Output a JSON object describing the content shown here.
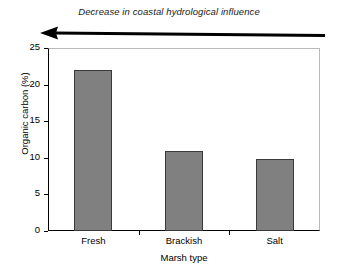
{
  "chart_data": {
    "type": "bar",
    "title": "",
    "subtitle": "",
    "categories": [
      "Fresh",
      "Brackish",
      "Salt"
    ],
    "values": [
      22,
      10.9,
      9.8
    ],
    "xlabel": "Marsh type",
    "ylabel": "Organic carbon (%)",
    "ylim": [
      0,
      25
    ],
    "yticks": [
      0,
      5,
      10,
      15,
      20,
      25
    ],
    "ytick_labels": [
      "0",
      "5",
      "10",
      "15",
      "20",
      "25"
    ],
    "grid": false,
    "legend": "none",
    "bar_color": "#808080",
    "bar_edge_color": "#3a3a3a",
    "annotations": [
      {
        "name": "decrease-arrow-caption",
        "text": "Decrease in coastal hydrological influence",
        "style": "italic",
        "arrow_direction": "left"
      }
    ]
  },
  "annotation": {
    "caption": "Decrease in coastal hydrological influence",
    "arrow_name": "left-arrow-icon"
  },
  "axes": {
    "y_title": "Organic carbon (%)",
    "x_title": "Marsh type",
    "y_ticks": [
      {
        "label": "25",
        "value": 25
      },
      {
        "label": "20",
        "value": 20
      },
      {
        "label": "15",
        "value": 15
      },
      {
        "label": "10",
        "value": 10
      },
      {
        "label": "5",
        "value": 5
      },
      {
        "label": "0",
        "value": 0
      }
    ]
  },
  "bars": [
    {
      "label": "Fresh",
      "value": 22
    },
    {
      "label": "Brackish",
      "value": 10.9
    },
    {
      "label": "Salt",
      "value": 9.8
    }
  ],
  "colors": {
    "bar_fill": "#808080",
    "bar_edge": "#3a3a3a",
    "axis": "#000000",
    "frame": "#b9b9b9",
    "arrow": "#000000"
  }
}
